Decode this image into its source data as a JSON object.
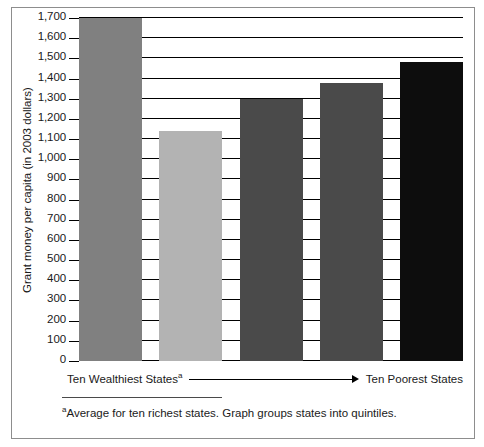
{
  "chart_data": {
    "type": "bar",
    "title": "",
    "xlabel": "",
    "ylabel": "Grant money per capita (in 2003 dollars)",
    "categories": [
      "Quintile 1",
      "Quintile 2",
      "Quintile 3",
      "Quintile 4",
      "Quintile 5"
    ],
    "values": [
      1700,
      1140,
      1300,
      1380,
      1480
    ],
    "colors": [
      "#808080",
      "#b3b3b3",
      "#4a4a4a",
      "#4a4a4a",
      "#0d0d0d"
    ],
    "ylim": [
      0,
      1700
    ],
    "ytick_step": 100,
    "ytick_labels": [
      "1,700",
      "1,600",
      "1,500",
      "1,400",
      "1,300",
      "1,200",
      "1,100",
      "1,000",
      "900",
      "800",
      "700",
      "600",
      "500",
      "400",
      "300",
      "200",
      "100",
      "0"
    ],
    "ytick_values": [
      1700,
      1600,
      1500,
      1400,
      1300,
      1200,
      1100,
      1000,
      900,
      800,
      700,
      600,
      500,
      400,
      300,
      200,
      100,
      0
    ],
    "grid": true,
    "grid_orientation": "horizontal",
    "legend": false,
    "legend_position": "none"
  },
  "axis_annotation": {
    "left_label": "Ten Wealthiest States",
    "left_label_marker": "a",
    "right_label": "Ten Poorest States",
    "arrow_direction": "right"
  },
  "footnote": {
    "marker": "a",
    "text": "Average for ten richest states. Graph groups states into quintiles."
  }
}
